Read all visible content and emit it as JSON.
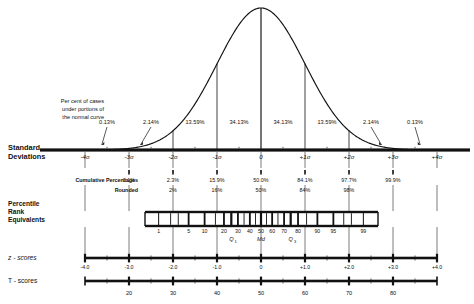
{
  "figure": {
    "title": "",
    "row_labels": {
      "percent_of_cases": "Per cent of cases\nunder portions of\nthe normal curve",
      "percent_line1": "Per cent of cases",
      "percent_line2": "under portions of",
      "percent_line3": "the normal curve",
      "standard_deviations_line1": "Standard",
      "standard_deviations_line2": "Deviations",
      "cumulative_percentages": "Cumulative Percentages",
      "rounded": "Rounded",
      "percentile_line1": "Percentile",
      "percentile_line2": "Rank",
      "percentile_line3": "Equivalents",
      "z_scores": "z - scores",
      "t_scores": "T - scores"
    }
  },
  "chart_data": {
    "type": "area",
    "xlabel": "Standard Deviations",
    "ylabel": "",
    "xlim": [
      -4,
      4
    ],
    "ylim": [
      0,
      1
    ],
    "grid": false,
    "legend": null,
    "curve": {
      "distribution": "standard normal",
      "mean": 0,
      "sd": 1,
      "peak_x": 0
    },
    "band_percentages": {
      "note": "Per cent of cases under portions of the normal curve",
      "intervals": [
        "-4σ to -3σ",
        "-3σ to -2σ",
        "-2σ to -1σ",
        "-1σ to 0",
        "0 to +1σ",
        "+1σ to +2σ",
        "+2σ to +3σ",
        "+3σ to +4σ"
      ],
      "values": [
        "0.13%",
        "2.14%",
        "13.59%",
        "34.13%",
        "34.13%",
        "13.59%",
        "2.14%",
        "0.13%"
      ]
    },
    "standard_deviations": {
      "ticks": [
        -4,
        -3,
        -2,
        -1,
        0,
        1,
        2,
        3,
        4
      ],
      "labels": [
        "-4σ",
        "-3σ",
        "-2σ",
        "-1σ",
        "0",
        "+1σ",
        "+2σ",
        "+3σ",
        "+4σ"
      ]
    },
    "cumulative_percentages": {
      "at_sd": [
        -3,
        -2,
        -1,
        0,
        1,
        2,
        3
      ],
      "values": [
        "0.1%",
        "2.3%",
        "15.9%",
        "50.0%",
        "84.1%",
        "97.7%",
        "99.9%"
      ]
    },
    "cumulative_rounded": {
      "at_sd": [
        -2,
        -1,
        0,
        1,
        2
      ],
      "values": [
        "2%",
        "16%",
        "50%",
        "84%",
        "98%"
      ]
    },
    "percentile_equivalents": {
      "labels": [
        "1",
        "5",
        "10",
        "20",
        "30",
        "40",
        "50",
        "60",
        "70",
        "80",
        "90",
        "95",
        "99"
      ],
      "values": [
        1,
        5,
        10,
        20,
        30,
        40,
        50,
        60,
        70,
        80,
        90,
        95,
        99
      ],
      "quartile_markers": [
        {
          "label": "Q",
          "sub": "1",
          "percentile": 25
        },
        {
          "label": "Md",
          "sub": "",
          "percentile": 50
        },
        {
          "label": "Q",
          "sub": "3",
          "percentile": 75
        }
      ]
    },
    "z_scores": {
      "at_sd": [
        -4,
        -3,
        -2,
        -1,
        0,
        1,
        2,
        3,
        4
      ],
      "labels": [
        "-4.0",
        "-3.0",
        "-2.0",
        "-1.0",
        "0",
        "+1.0",
        "+2.0",
        "+3.0",
        "+4.0"
      ]
    },
    "t_scores": {
      "at_sd": [
        -3,
        -2,
        -1,
        0,
        1,
        2,
        3
      ],
      "labels": [
        "20",
        "30",
        "40",
        "50",
        "60",
        "70",
        "80"
      ]
    }
  },
  "colors": {
    "ink": "#111111",
    "background": "#ffffff"
  }
}
